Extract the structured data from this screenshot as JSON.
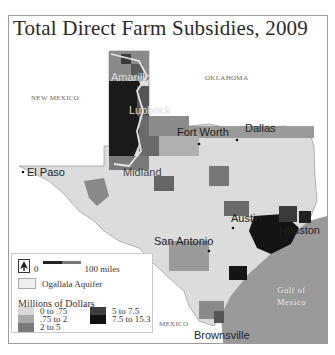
{
  "title": "Total Direct Farm Subsidies, 2009",
  "labels": {
    "states": [
      {
        "name": "NEW MEXICO",
        "x": 22,
        "y": 78
      },
      {
        "name": "OKLAHOMA",
        "x": 196,
        "y": 58
      },
      {
        "name": "MEXICO",
        "x": 150,
        "y": 304
      }
    ],
    "cities": [
      {
        "name": "Amarillo",
        "x": 102,
        "y": 67
      },
      {
        "name": "Lubbock",
        "x": 120,
        "y": 99
      },
      {
        "name": "Fort Worth",
        "x": 172,
        "y": 117
      },
      {
        "name": "Dallas",
        "x": 240,
        "y": 113
      },
      {
        "name": "El Paso",
        "x": 18,
        "y": 150
      },
      {
        "name": "Midland",
        "x": 118,
        "y": 154
      },
      {
        "name": "Austin",
        "x": 225,
        "y": 200
      },
      {
        "name": "San Antonio",
        "x": 172,
        "y": 222
      },
      {
        "name": "Houston",
        "x": 272,
        "y": 202
      },
      {
        "name": "Brownsville",
        "x": 188,
        "y": 318
      }
    ],
    "water": {
      "line1": "Gulf of",
      "line2": "Mexico"
    }
  },
  "legend": {
    "north_icon": "north-arrow-icon",
    "scale_start": "0",
    "scale_end": "100 miles",
    "aquifer_label": "Ogallala Aquifer",
    "heading": "Millions of Dollars",
    "classes": [
      {
        "label": "0 to .75",
        "color": "#d9d9d9"
      },
      {
        "label": ".75 to 2",
        "color": "#a9a9a9"
      },
      {
        "label": "2 to 5",
        "color": "#7a7a7a"
      },
      {
        "label": "5 to 7.5",
        "color": "#3e3e3e"
      },
      {
        "label": "7.5 to 15.3",
        "color": "#121212"
      }
    ]
  },
  "colors": {
    "gulf": "#9a9a9a",
    "frame": "#9a9a9a",
    "aquifer_outline": "#e6e6e6"
  }
}
